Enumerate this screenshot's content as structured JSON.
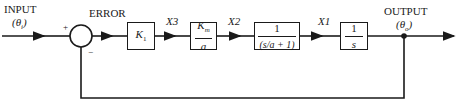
{
  "diagram": {
    "type": "block-diagram",
    "input": {
      "label": "INPUT",
      "symbol": "(θ_i)",
      "symbol_main": "(θ",
      "symbol_sub": "i",
      "symbol_close": ")"
    },
    "summing_junction": {
      "label": "ERROR",
      "plus_sign": "+",
      "minus_sign": "−"
    },
    "blocks": [
      {
        "id": "k1",
        "main": "K",
        "sub": "1"
      },
      {
        "id": "km_a",
        "numerator_main": "K",
        "numerator_sub": "m",
        "denominator": "a"
      },
      {
        "id": "lag",
        "numerator": "1",
        "denominator": "(s/a + 1)"
      },
      {
        "id": "integrator",
        "numerator": "1",
        "denominator": "s"
      }
    ],
    "signals": {
      "x3": "X3",
      "x2": "X2",
      "x1": "X1"
    },
    "output": {
      "label": "OUTPUT",
      "symbol_main": "(θ",
      "symbol_sub": "o",
      "symbol_close": ")"
    },
    "feedback": "unity negative feedback from output to summing junction"
  }
}
